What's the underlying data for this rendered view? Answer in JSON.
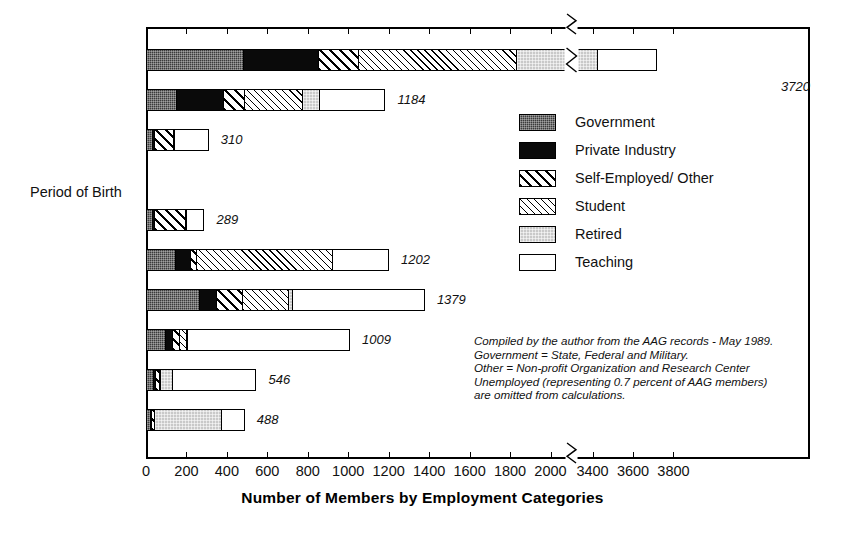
{
  "axis": {
    "x_title": "Number of Members by Employment Categories",
    "x_ticks": [
      "0",
      "200",
      "400",
      "600",
      "800",
      "1000",
      "1200",
      "1400",
      "1600",
      "1800",
      "2000",
      "3400",
      "3600",
      "3800"
    ],
    "period_header": "Period of Birth"
  },
  "legend": {
    "items": [
      {
        "key": "government",
        "label": "Government",
        "swatch": "f-gov"
      },
      {
        "key": "private",
        "label": "Private Industry",
        "swatch": "f-priv"
      },
      {
        "key": "self",
        "label": "Self-Employed/ Other",
        "swatch": "f-self"
      },
      {
        "key": "student",
        "label": "Student",
        "swatch": "f-stud"
      },
      {
        "key": "retired",
        "label": "Retired",
        "swatch": "f-ret"
      },
      {
        "key": "teaching",
        "label": "Teaching",
        "swatch": "f-teach"
      }
    ]
  },
  "note": {
    "line1": "Compiled by the author from the AAG records - May 1989.",
    "line2": "Government = State, Federal and Military.",
    "line3": "Other = Non-profit Organization and Research Center",
    "line4": "Unemployed (representing 0.7 percent of AAG members)",
    "line5": "are omitted from calculations."
  },
  "chart_data": {
    "type": "bar",
    "orientation": "horizontal",
    "stacked": true,
    "title": "",
    "xlabel": "Number of Members by Employment Categories",
    "ylabel": "",
    "xlim": [
      0,
      3800
    ],
    "axis_break": {
      "from": 2000,
      "to": 3400
    },
    "grid": false,
    "legend_position": "inside-right",
    "categories": [
      "Males",
      "Females",
      "Minorities",
      "After 1964",
      "1955 to 1964",
      "1945 to 1954",
      "1935 to 1944",
      "1925 to 1934",
      "Before 1925"
    ],
    "series": [
      {
        "name": "Government",
        "values": [
          480,
          150,
          30,
          30,
          145,
          260,
          95,
          35,
          20
        ]
      },
      {
        "name": "Private Industry",
        "values": [
          370,
          230,
          10,
          10,
          72,
          85,
          35,
          8,
          5
        ]
      },
      {
        "name": "Self-Employed/ Other",
        "values": [
          200,
          105,
          95,
          155,
          30,
          130,
          35,
          20,
          15
        ]
      },
      {
        "name": "Student",
        "values": [
          1970,
          285,
          5,
          5,
          675,
          225,
          35,
          5,
          0
        ]
      },
      {
        "name": "Retired",
        "values": [
          400,
          85,
          0,
          0,
          0,
          20,
          5,
          60,
          330
        ]
      },
      {
        "name": "Teaching",
        "values": [
          300,
          329,
          170,
          89,
          280,
          659,
          804,
          418,
          118
        ]
      }
    ],
    "totals": [
      3720,
      1184,
      310,
      289,
      1202,
      1379,
      1009,
      546,
      488
    ],
    "total_labels": [
      "3720",
      "1184",
      "310",
      "289",
      "1202",
      "1379",
      "1009",
      "546",
      "488"
    ]
  }
}
